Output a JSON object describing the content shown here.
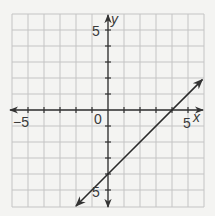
{
  "chart_data": {
    "type": "line",
    "title": "",
    "xlabel": "x",
    "ylabel": "y",
    "xlim": [
      -6,
      6
    ],
    "ylim": [
      -6,
      6
    ],
    "grid": true,
    "grid_step": 1,
    "x_tick_labels": [
      {
        "value": -5,
        "label": "−5"
      },
      {
        "value": 5,
        "label": "5"
      }
    ],
    "y_tick_labels": [
      {
        "value": 5,
        "label": "5"
      },
      {
        "value": -5,
        "label": "5"
      }
    ],
    "origin_label": "0",
    "series": [
      {
        "name": "y = x - 4",
        "slope": 1,
        "intercept": -4,
        "x": [
          -2,
          0,
          4,
          5.9
        ],
        "values": [
          -6,
          -4,
          0,
          1.9
        ],
        "arrows_both_ends": true
      }
    ]
  },
  "colors": {
    "background": "#f4f4f2",
    "grid": "#c4c4c4",
    "axis": "#333333",
    "line": "#2a2a2a",
    "text": "#3a3a3a"
  },
  "layout": {
    "grid_left": 12,
    "grid_top": 14,
    "cell": 16,
    "cells": 12,
    "origin_px": [
      108,
      110
    ]
  }
}
